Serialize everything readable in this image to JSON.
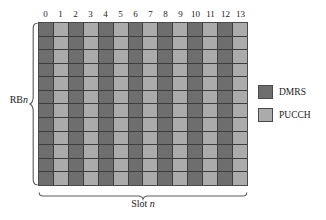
{
  "figure": {
    "type": "resource-grid-diagram",
    "row_count": 12,
    "column_count": 14
  },
  "axes": {
    "column_labels": [
      "0",
      "1",
      "2",
      "3",
      "4",
      "5",
      "6",
      "7",
      "8",
      "9",
      "10",
      "11",
      "12",
      "13"
    ],
    "vertical_label_prefix": "RB",
    "vertical_label_italic": "n",
    "horizontal_label_prefix": "Slot ",
    "horizontal_label_italic": "n"
  },
  "legend": {
    "items": [
      {
        "label": "DMRS",
        "color": "#6e6e6e"
      },
      {
        "label": "PUCCH",
        "color": "#ababab"
      }
    ]
  },
  "colors": {
    "dmrs": "#6e6e6e",
    "pucch": "#ababab",
    "grid_line": "#3d3d3d",
    "border": "#4a4a4a",
    "background": "#ffffff",
    "text": "#1a1a1a"
  },
  "grid_data": {
    "column_types": [
      "DMRS",
      "PUCCH",
      "DMRS",
      "PUCCH",
      "DMRS",
      "PUCCH",
      "DMRS",
      "PUCCH",
      "DMRS",
      "PUCCH",
      "DMRS",
      "PUCCH",
      "DMRS",
      "PUCCH"
    ]
  }
}
